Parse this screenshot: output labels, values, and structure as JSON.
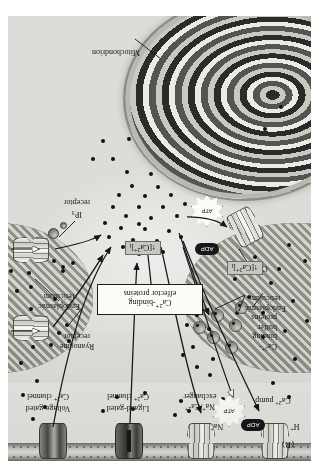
{
  "figure": {
    "panel_label": "(B)",
    "caption_subject": "Calcium signaling: sources and sinks of cytosolic Ca2+",
    "orientation_note": "figure printed rotated 180 degrees"
  },
  "organelles": {
    "mitochondrion": "Mitochondrion",
    "er_left": "Endoplasmic\nreticulum",
    "er_left_line1": "Endoplasmic",
    "er_left_line2": "reticulum",
    "er_right_line1": "Endoplasmic",
    "er_right_line2": "reticulum"
  },
  "proteins": {
    "buffer_line1": "Ca2+-",
    "buffer_line2": "binding",
    "buffer_line3": "buffer",
    "buffer_line4": "proteins",
    "effector_line1": "Ca2+-binding",
    "effector_line2": "effector proteins",
    "er_pump": "Ca2+ pump",
    "ryanodine_line1": "Ryanodine",
    "ryanodine_line2": "receptor",
    "ip3_line1": "IP3",
    "ip3_line2": "receptor"
  },
  "membrane_transporters": [
    {
      "id": "pm-ca-pump",
      "line1": "Ca2+ pump",
      "line2": "",
      "ion": "H+"
    },
    {
      "id": "na-ca-exchanger",
      "line1": "Na+/Ca2+",
      "line2": "exchanger",
      "ion": "Na+"
    },
    {
      "id": "ligand-gated",
      "line1": "Ligand-gated",
      "line2": "Ca2+ channel",
      "ion": ""
    },
    {
      "id": "voltage-gated",
      "line1": "Voltage-gated",
      "line2": "Ca2+ channel",
      "ion": ""
    }
  ],
  "indicators": {
    "ca_increase_left": "[Ca2+]i",
    "ca_increase_right": "[Ca2+]i",
    "arrow_glyph": "↑"
  },
  "energy": {
    "adp_left": "ADP",
    "atp_left": "ATP",
    "adp_pm": "ADP",
    "atp_pm": "ATP"
  },
  "colors": {
    "background": "#ffffff",
    "cytosol": "#e7e6e3",
    "membrane_dark": "#6f6f6b",
    "er_lumen": "#3a3a37",
    "mito_dark": "#2b2b29",
    "ca_dot": "#111110",
    "shaded_box": "#c7c7c1",
    "ink": "#16161a"
  }
}
